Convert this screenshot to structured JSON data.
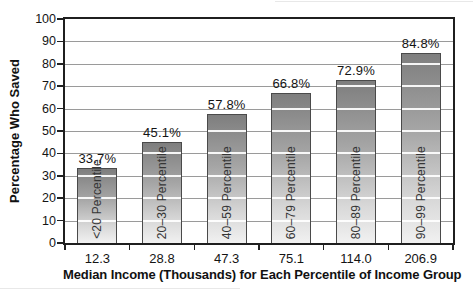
{
  "chart_data": {
    "type": "bar",
    "title": "",
    "ylabel": "Percentage Who Saved",
    "xlabel": "Median Income (Thousands) for Each Percentile of Income Group",
    "ylim": [
      0,
      100
    ],
    "ytick_step": 10,
    "yticks": [
      100,
      90,
      80,
      70,
      60,
      50,
      40,
      30,
      20,
      10,
      0
    ],
    "grid": true,
    "legend": false,
    "categories": [
      "12.3",
      "28.8",
      "47.3",
      "75.1",
      "114.0",
      "206.9"
    ],
    "values": [
      33.7,
      45.1,
      57.8,
      66.8,
      72.9,
      84.8
    ],
    "value_labels": [
      "33.7%",
      "45.1%",
      "57.8%",
      "66.8%",
      "72.9%",
      "84.8%"
    ],
    "bar_labels": [
      "<20 Percentile",
      "20–30 Percentile",
      "40–59 Percentile",
      "60–79 Percentile",
      "80–89 Percentile",
      "90–99 Percentile"
    ],
    "colors": {
      "bar_gradient_top": "#7e7e7e",
      "bar_gradient_bottom": "#f1f1f1",
      "bar_border": "#4a4a4a",
      "gridline": "#9a9a9a",
      "axis_frame": "#1f1f1f",
      "text": "#141414",
      "background": "#ffffff"
    }
  }
}
